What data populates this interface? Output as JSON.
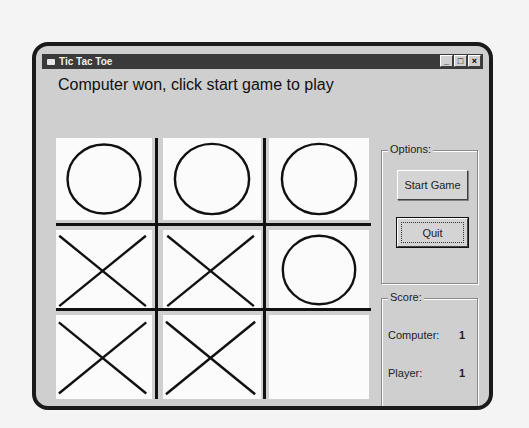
{
  "window": {
    "title": "Tic Tac Toe",
    "controls": {
      "minimize": "_",
      "maximize": "□",
      "close": "×"
    }
  },
  "status_message": "Computer won, click start game to play",
  "board": {
    "cells": [
      "O",
      "O",
      "O",
      "X",
      "X",
      "O",
      "X",
      "X",
      ""
    ]
  },
  "options": {
    "legend": "Options:",
    "start_label": "Start Game",
    "quit_label": "Quit"
  },
  "score": {
    "legend": "Score:",
    "rows": [
      {
        "label": "Computer:",
        "value": "1"
      },
      {
        "label": "Player:",
        "value": "1"
      },
      {
        "label": "Tie:",
        "value": "0"
      }
    ]
  }
}
